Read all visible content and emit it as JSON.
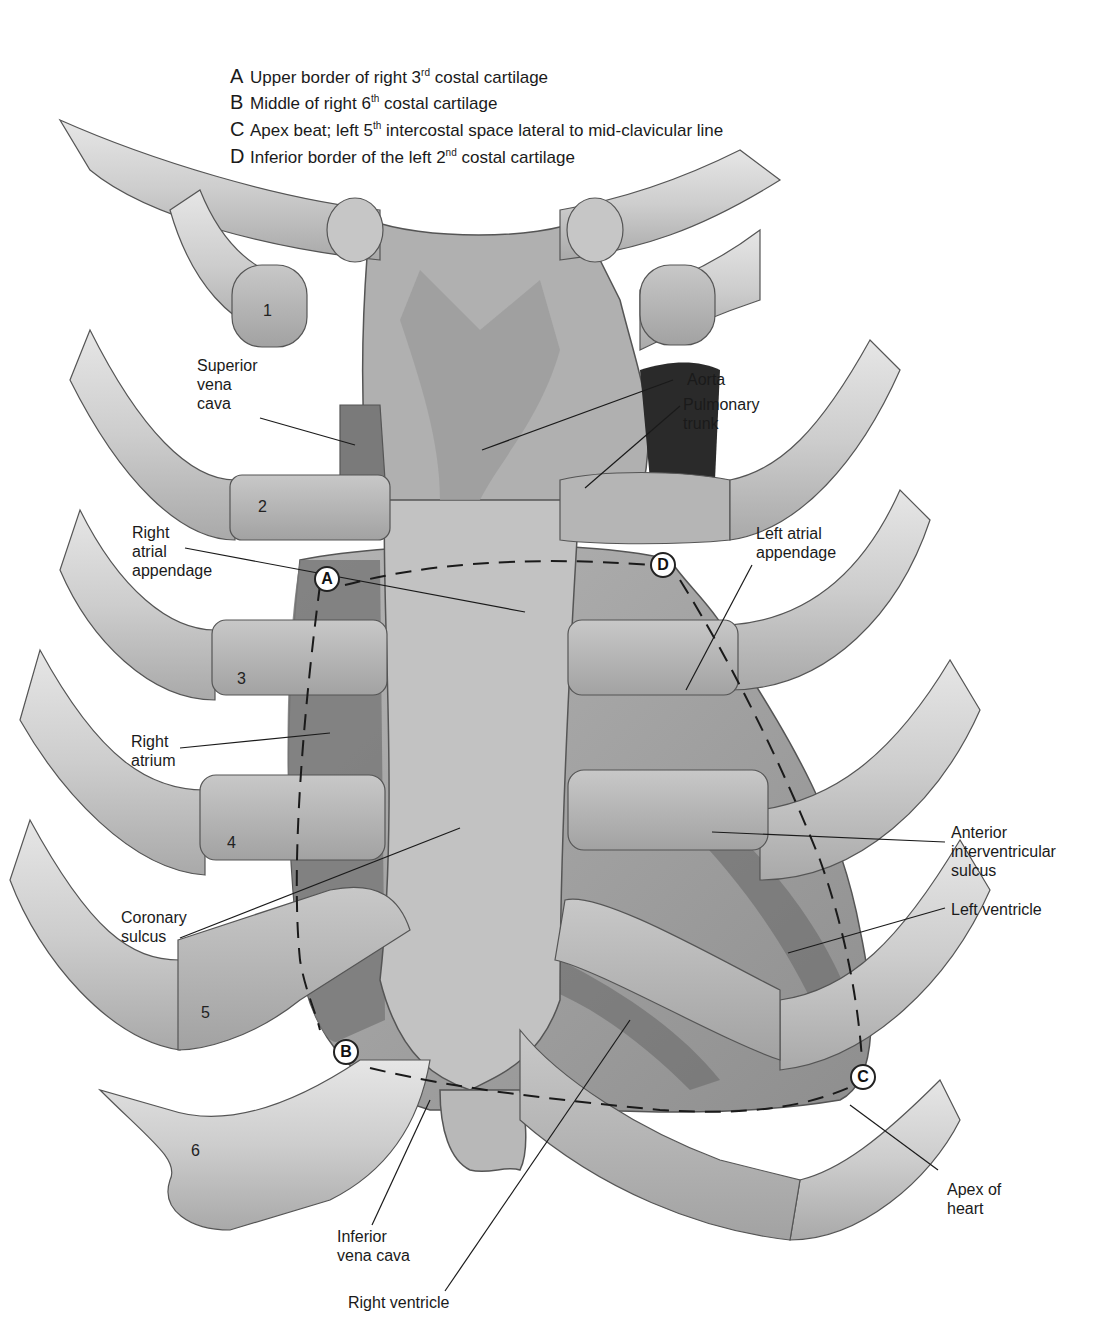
{
  "figure": {
    "legend": [
      {
        "key": "A",
        "text_before": "Upper border of right 3",
        "sup": "rd",
        "text_after": " costal cartilage"
      },
      {
        "key": "B",
        "text_before": "Middle of right 6",
        "sup": "th",
        "text_after": " costal cartilage"
      },
      {
        "key": "C",
        "text_before": "Apex beat; left 5",
        "sup": "th",
        "text_after": " intercostal space lateral to mid-clavicular line"
      },
      {
        "key": "D",
        "text_before": "Inferior border of the left 2",
        "sup": "nd",
        "text_after": " costal cartilage"
      }
    ],
    "rib_numbers": [
      "1",
      "2",
      "3",
      "4",
      "5",
      "6"
    ],
    "markers": [
      "A",
      "B",
      "C",
      "D"
    ],
    "labels": {
      "superior_vena_cava": [
        "Superior",
        "vena",
        "cava"
      ],
      "aorta": [
        "Aorta"
      ],
      "pulmonary_trunk": [
        "Pulmonary",
        "trunk"
      ],
      "right_atrial_appendage": [
        "Right",
        "atrial",
        "appendage"
      ],
      "left_atrial_appendage": [
        "Left atrial",
        "appendage"
      ],
      "right_atrium": [
        "Right",
        "atrium"
      ],
      "anterior_interventricular_sulcus": [
        "Anterior",
        "interventricular",
        "sulcus"
      ],
      "coronary_sulcus": [
        "Coronary",
        "sulcus"
      ],
      "left_ventricle": [
        "Left ventricle"
      ],
      "apex_of_heart": [
        "Apex of",
        "heart"
      ],
      "inferior_vena_cava": [
        "Inferior",
        "vena cava"
      ],
      "right_ventricle": [
        "Right ventricle"
      ]
    },
    "colors": {
      "rib": "#cfcfcf",
      "cartilage": "#b9b9b9",
      "heart": "#a8a8a8",
      "heart_dark": "#7a7a7a",
      "outline": "#555555",
      "line": "#222222"
    }
  }
}
